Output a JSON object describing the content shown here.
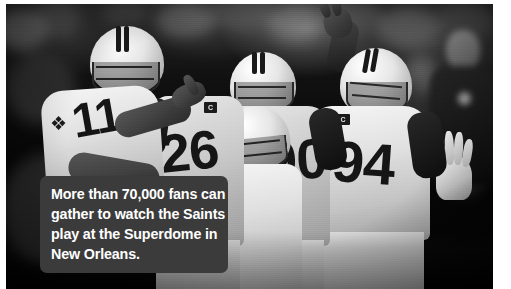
{
  "page": {
    "background_color": "#ffffff",
    "width": 511,
    "height": 289
  },
  "photo": {
    "name": "new-orleans-saints-players-celebrating",
    "description": "Black-and-white photograph of New Orleans Saints football players in white jerseys celebrating on the field, with a blurred stadium crowd behind them.",
    "treatment": "black-and-white",
    "players": [
      {
        "position": "left",
        "jersey_number": "11",
        "has_helmet": true
      },
      {
        "position": "center-left",
        "jersey_number": "26",
        "has_helmet": true
      },
      {
        "position": "center",
        "jersey_number": "",
        "has_helmet": true
      },
      {
        "position": "center-right",
        "jersey_number": "90",
        "has_helmet": true
      },
      {
        "position": "right",
        "jersey_number": "94",
        "has_helmet": true,
        "captain_patch": "C"
      }
    ],
    "team_logo": "fleur-de-lis"
  },
  "caption": {
    "lines": [
      "More than 70,000 fans can",
      "gather to watch the Saints",
      "play at the Superdome in",
      "New Orleans."
    ],
    "full_text": "More than 70,000 fans can gather to watch the Saints play at the Superdome in New Orleans.",
    "background_color": "#3b3b3b",
    "text_color": "#ffffff"
  }
}
